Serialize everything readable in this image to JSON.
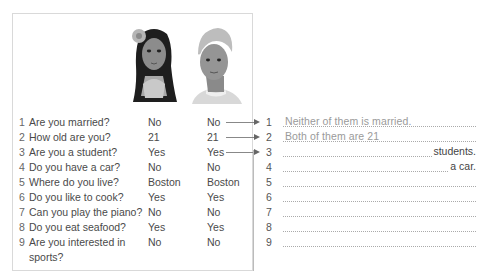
{
  "questionnaire": {
    "people": [
      "woman-portrait",
      "man-portrait"
    ],
    "rows": [
      {
        "num": "1",
        "question": "Are you married?",
        "answer_a": "No",
        "answer_b": "No"
      },
      {
        "num": "2",
        "question": "How old are you?",
        "answer_a": "21",
        "answer_b": "21"
      },
      {
        "num": "3",
        "question": "Are you a student?",
        "answer_a": "Yes",
        "answer_b": "Yes"
      },
      {
        "num": "4",
        "question": "Do you have a car?",
        "answer_a": "No",
        "answer_b": "No"
      },
      {
        "num": "5",
        "question": "Where do you live?",
        "answer_a": "Boston",
        "answer_b": "Boston"
      },
      {
        "num": "6",
        "question": "Do you like to cook?",
        "answer_a": "Yes",
        "answer_b": "Yes"
      },
      {
        "num": "7",
        "question": "Can you play the piano?",
        "answer_a": "No",
        "answer_b": "No"
      },
      {
        "num": "8",
        "question": "Do you eat seafood?",
        "answer_a": "Yes",
        "answer_b": "Yes"
      },
      {
        "num": "9",
        "question": "Are you interested in",
        "question_cont": "sports?",
        "answer_a": "No",
        "answer_b": "No"
      }
    ]
  },
  "answers": [
    {
      "num": "1",
      "hint": "Neither of them is married.",
      "tail": ""
    },
    {
      "num": "2",
      "hint": "Both of them are 21",
      "tail": ""
    },
    {
      "num": "3",
      "hint": "",
      "tail": "students."
    },
    {
      "num": "4",
      "hint": "",
      "tail": "a car."
    },
    {
      "num": "5",
      "hint": "",
      "tail": ""
    },
    {
      "num": "6",
      "hint": "",
      "tail": ""
    },
    {
      "num": "7",
      "hint": "",
      "tail": ""
    },
    {
      "num": "8",
      "hint": "",
      "tail": ""
    },
    {
      "num": "9",
      "hint": "",
      "tail": ""
    }
  ]
}
